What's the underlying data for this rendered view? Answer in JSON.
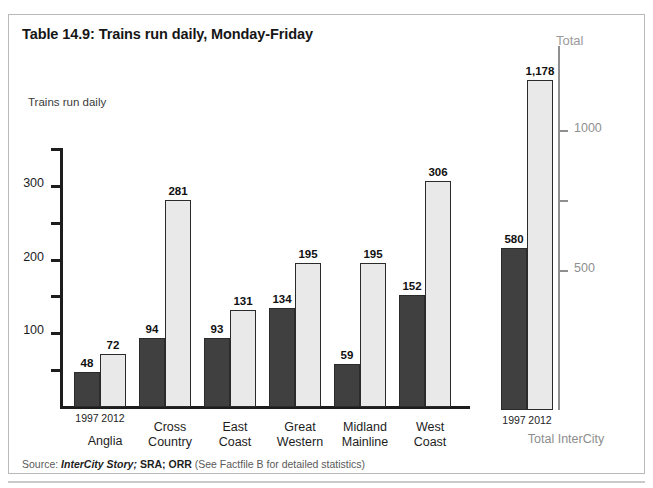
{
  "title": "Table 14.9: Trains run daily, Monday-Friday",
  "y_axis_label": "Trains run daily",
  "total_panel_label": "Total",
  "source": {
    "prefix": "Source:",
    "italic": "InterCity Story;",
    "bold": "SRA; ORR",
    "note": "(See Factfile B for detailed statistics)"
  },
  "colors": {
    "bar_1997": "#404040",
    "bar_2012": "#e9e9e9",
    "bar_border": "#2b2b2b",
    "axis": "#1d1d1d",
    "total_axis": "#8f8f8f",
    "frame": "#b9b9b9"
  },
  "chart_data": {
    "type": "bar",
    "title": "Table 14.9: Trains run daily, Monday-Friday",
    "xlabel": "",
    "ylabel": "Trains run daily",
    "ylim": [
      0,
      350
    ],
    "grid": false,
    "legend": "none",
    "categories": [
      "Anglia",
      "Cross Country",
      "East Coast",
      "Great Western",
      "Midland Mainline",
      "West Coast"
    ],
    "category_lines": [
      [
        "",
        "Anglia"
      ],
      [
        "Cross",
        "Country"
      ],
      [
        "East",
        "Coast"
      ],
      [
        "Great",
        "Western"
      ],
      [
        "Midland",
        "Mainline"
      ],
      [
        "West",
        "Coast"
      ]
    ],
    "series": [
      {
        "name": "1997",
        "values": [
          48,
          94,
          93,
          134,
          59,
          152
        ]
      },
      {
        "name": "2012",
        "values": [
          72,
          281,
          131,
          195,
          195,
          306
        ]
      }
    ],
    "ytick_labels": [
      "100",
      "200",
      "300"
    ],
    "ytick_values": [
      100,
      200,
      300
    ],
    "yminor_ticks": [
      50,
      150,
      250,
      350
    ],
    "year_labels": [
      "1997",
      "2012"
    ],
    "secondary_panel": {
      "label": "Total",
      "category": "Total InterCity",
      "ylim": [
        0,
        1300
      ],
      "ytick_labels": [
        "500",
        "1000"
      ],
      "ytick_values": [
        500,
        1000
      ],
      "yminor_ticks": [
        0,
        750
      ],
      "series": [
        {
          "name": "1997",
          "value": 580,
          "value_label": "580"
        },
        {
          "name": "2012",
          "value": 1178,
          "value_label": "1,178"
        }
      ],
      "year_labels": [
        "1997",
        "2012"
      ]
    }
  }
}
